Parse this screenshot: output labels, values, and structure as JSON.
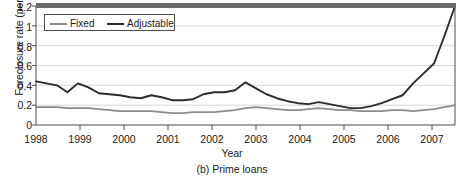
{
  "figure": {
    "caption": "(b) Prime loans",
    "ylabel": "Foreclosure rate (percent)",
    "xlabel": "Year"
  },
  "legend": {
    "position": "top-left-inside",
    "entries": [
      {
        "label": "Fixed",
        "color": "#8c8c8c",
        "swatch_name": "fixed-line-swatch"
      },
      {
        "label": "Adjustable",
        "color": "#2b2b2b",
        "swatch_name": "adjustable-line-swatch"
      }
    ]
  },
  "axes": {
    "y_ticks": [
      "1.2",
      "1",
      "0.8",
      "0.6",
      "0.4",
      "0.2",
      "0"
    ],
    "x_ticks": [
      "1998",
      "1999",
      "2000",
      "2001",
      "2002",
      "2003",
      "2004",
      "2005",
      "2006",
      "2007"
    ]
  },
  "chart_data": {
    "type": "line",
    "title": "(b) Prime loans",
    "xlabel": "Year",
    "ylabel": "Foreclosure rate (percent)",
    "xlim": [
      1998.0,
      2008.0
    ],
    "ylim": [
      0,
      1.2
    ],
    "yticks": [
      0,
      0.2,
      0.4,
      0.6,
      0.8,
      1.0,
      1.2
    ],
    "xticks": [
      1998,
      1999,
      2000,
      2001,
      2002,
      2003,
      2004,
      2005,
      2006,
      2007
    ],
    "grid": "horizontal",
    "legend_position": "upper left",
    "x": [
      1998.0,
      1998.25,
      1998.5,
      1998.75,
      1999.0,
      1999.25,
      1999.5,
      1999.75,
      2000.0,
      2000.25,
      2000.5,
      2000.75,
      2001.0,
      2001.25,
      2001.5,
      2001.75,
      2002.0,
      2002.25,
      2002.5,
      2002.75,
      2003.0,
      2003.25,
      2003.5,
      2003.75,
      2004.0,
      2004.25,
      2004.5,
      2004.75,
      2005.0,
      2005.25,
      2005.5,
      2005.75,
      2006.0,
      2006.25,
      2006.5,
      2006.75,
      2007.0,
      2007.25,
      2007.5,
      2007.75,
      2008.0
    ],
    "series": [
      {
        "name": "Adjustable",
        "color": "#2b2b2b",
        "values": [
          0.44,
          0.42,
          0.4,
          0.33,
          0.42,
          0.38,
          0.32,
          0.31,
          0.3,
          0.28,
          0.27,
          0.3,
          0.28,
          0.25,
          0.25,
          0.26,
          0.31,
          0.33,
          0.33,
          0.35,
          0.43,
          0.37,
          0.31,
          0.27,
          0.24,
          0.22,
          0.21,
          0.23,
          0.21,
          0.19,
          0.17,
          0.17,
          0.19,
          0.22,
          0.26,
          0.3,
          0.42,
          0.52,
          0.62,
          0.9,
          1.2
        ]
      },
      {
        "name": "Fixed",
        "color": "#8c8c8c",
        "values": [
          0.18,
          0.18,
          0.18,
          0.17,
          0.17,
          0.17,
          0.16,
          0.15,
          0.14,
          0.14,
          0.14,
          0.14,
          0.13,
          0.12,
          0.12,
          0.13,
          0.13,
          0.13,
          0.14,
          0.15,
          0.17,
          0.18,
          0.17,
          0.16,
          0.15,
          0.15,
          0.16,
          0.17,
          0.16,
          0.15,
          0.15,
          0.14,
          0.14,
          0.14,
          0.15,
          0.15,
          0.14,
          0.15,
          0.16,
          0.18,
          0.2
        ]
      }
    ]
  }
}
